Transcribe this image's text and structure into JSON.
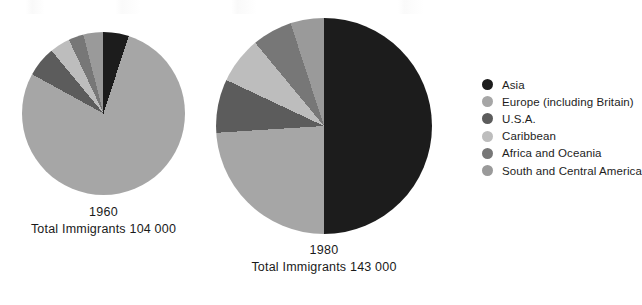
{
  "chart_data": {
    "type": "pie",
    "title": "",
    "legend_position": "right",
    "categories": [
      "Asia",
      "Europe (including Britain)",
      "U.S.A.",
      "Caribbean",
      "Africa and Oceania",
      "South and Central America"
    ],
    "colors": [
      "#1c1c1c",
      "#a6a6a6",
      "#5c5c5c",
      "#bdbdbd",
      "#777777",
      "#9a9a9a"
    ],
    "charts": [
      {
        "name": "1960",
        "year": "1960",
        "total_label": "Total Immigrants 104 000",
        "total_value": 104000,
        "diameter_px": 163,
        "values": [
          5,
          78,
          6,
          4,
          3,
          4
        ],
        "slices": [
          {
            "label": "Asia",
            "percent": 5,
            "color": "#1c1c1c"
          },
          {
            "label": "Europe (including Britain)",
            "percent": 78,
            "color": "#a6a6a6"
          },
          {
            "label": "U.S.A.",
            "percent": 6,
            "color": "#5c5c5c"
          },
          {
            "label": "Caribbean",
            "percent": 4,
            "color": "#bdbdbd"
          },
          {
            "label": "Africa and Oceania",
            "percent": 3,
            "color": "#777777"
          },
          {
            "label": "South and Central America",
            "percent": 4,
            "color": "#9a9a9a"
          }
        ]
      },
      {
        "name": "1980",
        "year": "1980",
        "total_label": "Total Immigrants 143 000",
        "total_value": 143000,
        "diameter_px": 216,
        "values": [
          50,
          24,
          8,
          7,
          6,
          5
        ],
        "slices": [
          {
            "label": "Asia",
            "percent": 50,
            "color": "#1c1c1c"
          },
          {
            "label": "Europe (including Britain)",
            "percent": 24,
            "color": "#a6a6a6"
          },
          {
            "label": "U.S.A.",
            "percent": 8,
            "color": "#5c5c5c"
          },
          {
            "label": "Caribbean",
            "percent": 7,
            "color": "#bdbdbd"
          },
          {
            "label": "Africa and Oceania",
            "percent": 6,
            "color": "#777777"
          },
          {
            "label": "South and Central America",
            "percent": 5,
            "color": "#9a9a9a"
          }
        ]
      }
    ]
  },
  "legend": {
    "items": [
      {
        "label": "Asia",
        "color": "#1c1c1c"
      },
      {
        "label": "Europe (including Britain)",
        "color": "#a6a6a6"
      },
      {
        "label": "U.S.A.",
        "color": "#5c5c5c"
      },
      {
        "label": "Caribbean",
        "color": "#bdbdbd"
      },
      {
        "label": "Africa and Oceania",
        "color": "#777777"
      },
      {
        "label": "South and Central America",
        "color": "#9a9a9a"
      }
    ]
  },
  "captions": {
    "left_year": "1960",
    "left_total": "Total Immigrants 104 000",
    "right_year": "1980",
    "right_total": "Total Immigrants 143 000"
  }
}
